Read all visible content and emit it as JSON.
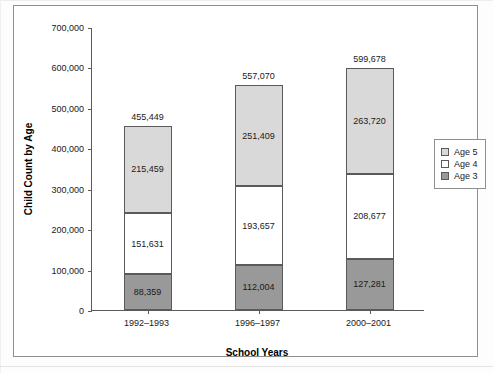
{
  "chart_data": {
    "type": "bar",
    "subtype": "stacked-bar",
    "title": "",
    "xlabel": "School Years",
    "ylabel": "Child Count by Age",
    "categories": [
      "1992–1993",
      "1996–1997",
      "2000–2001"
    ],
    "series": [
      {
        "name": "Age 3",
        "values": [
          88359,
          112004,
          127281
        ],
        "color": "#999999",
        "labels": [
          "88,359",
          "112,004",
          "127,281"
        ]
      },
      {
        "name": "Age 4",
        "values": [
          151631,
          193657,
          208677
        ],
        "color": "#ffffff",
        "labels": [
          "151,631",
          "193,657",
          "208,677"
        ]
      },
      {
        "name": "Age 5",
        "values": [
          215459,
          251409,
          263720
        ],
        "color": "#d9d9d9",
        "labels": [
          "215,459",
          "251,409",
          "263,720"
        ]
      }
    ],
    "totals": [
      455449,
      557070,
      599678
    ],
    "total_labels": [
      "455,449",
      "557,070",
      "599,678"
    ],
    "ylim": [
      0,
      700000
    ],
    "ytick_values": [
      0,
      100000,
      200000,
      300000,
      400000,
      500000,
      600000,
      700000
    ],
    "ytick_labels": [
      "0",
      "100,000",
      "200,000",
      "300,000",
      "400,000",
      "500,000",
      "600,000",
      "700,000"
    ],
    "grid": false,
    "legend_position": "right",
    "legend_entries": [
      "Age 5",
      "Age 4",
      "Age 3"
    ]
  },
  "legend": {
    "entries": [
      {
        "label": "Age 5",
        "color": "#d9d9d9"
      },
      {
        "label": "Age 4",
        "color": "#ffffff"
      },
      {
        "label": "Age 3",
        "color": "#999999"
      }
    ]
  },
  "axes": {
    "y_title": "Child Count by Age",
    "x_title": "School Years"
  }
}
